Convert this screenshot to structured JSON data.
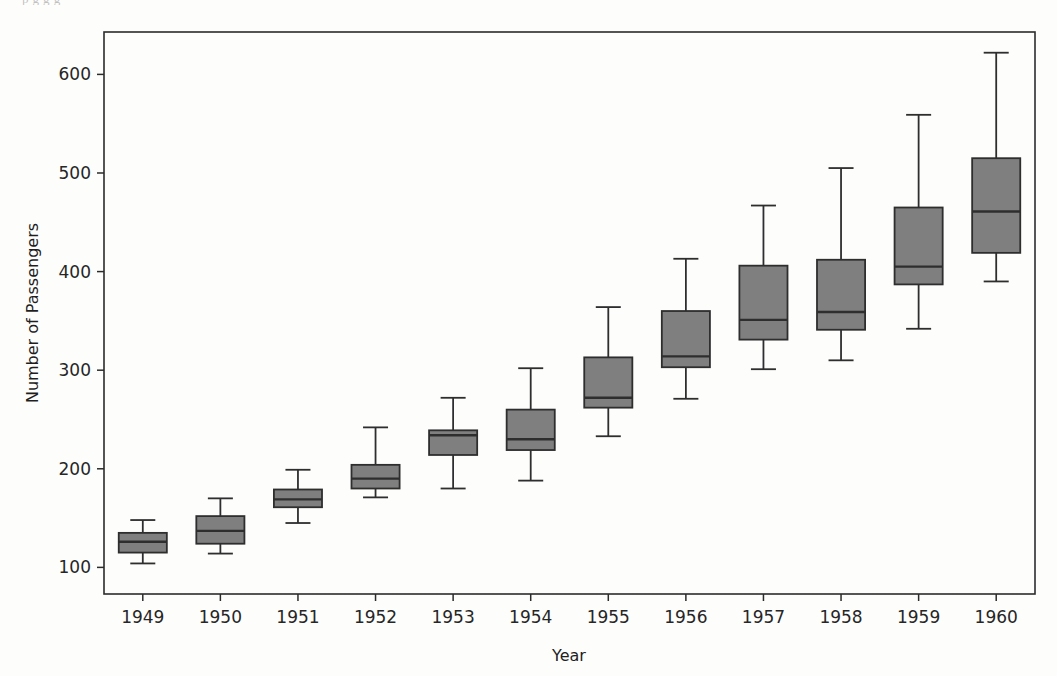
{
  "figure": {
    "background_color": "#fdfdfc",
    "plot_area": {
      "left": 104,
      "top": 32,
      "right": 1035,
      "bottom": 594
    },
    "frame_color": "#2b2b2b",
    "scan_artifact_top_text": "p    g        g              g"
  },
  "chart_data": {
    "type": "box",
    "title": "",
    "xlabel": "Year",
    "ylabel": "Number of Passengers",
    "categories": [
      "1949",
      "1950",
      "1951",
      "1952",
      "1953",
      "1954",
      "1955",
      "1956",
      "1957",
      "1958",
      "1959",
      "1960"
    ],
    "ylim": [
      73,
      643
    ],
    "yticks": [
      100,
      200,
      300,
      400,
      500,
      600
    ],
    "ytick_labels": [
      "100",
      "200",
      "300",
      "400",
      "500",
      "600"
    ],
    "grid": false,
    "legend": null,
    "box_fill_color": "#7f7f7f",
    "box_edge_color": "#2e2e2e",
    "median_color": "#2e2e2e",
    "whisker_color": "#2e2e2e",
    "boxes": [
      {
        "category": "1949",
        "whisker_low": 104,
        "q1": 115,
        "median": 126,
        "q3": 135,
        "whisker_high": 148
      },
      {
        "category": "1950",
        "whisker_low": 114,
        "q1": 124,
        "median": 137,
        "q3": 152,
        "whisker_high": 170
      },
      {
        "category": "1951",
        "whisker_low": 145,
        "q1": 161,
        "median": 169,
        "q3": 179,
        "whisker_high": 199
      },
      {
        "category": "1952",
        "whisker_low": 171,
        "q1": 180,
        "median": 190,
        "q3": 204,
        "whisker_high": 242
      },
      {
        "category": "1953",
        "whisker_low": 180,
        "q1": 214,
        "median": 234,
        "q3": 239,
        "whisker_high": 272
      },
      {
        "category": "1954",
        "whisker_low": 188,
        "q1": 219,
        "median": 230,
        "q3": 260,
        "whisker_high": 302
      },
      {
        "category": "1955",
        "whisker_low": 233,
        "q1": 262,
        "median": 272,
        "q3": 313,
        "whisker_high": 364
      },
      {
        "category": "1956",
        "whisker_low": 271,
        "q1": 303,
        "median": 314,
        "q3": 360,
        "whisker_high": 413
      },
      {
        "category": "1957",
        "whisker_low": 301,
        "q1": 331,
        "median": 351,
        "q3": 406,
        "whisker_high": 467
      },
      {
        "category": "1958",
        "whisker_low": 310,
        "q1": 341,
        "median": 359,
        "q3": 412,
        "whisker_high": 505
      },
      {
        "category": "1959",
        "whisker_low": 342,
        "q1": 387,
        "median": 405,
        "q3": 465,
        "whisker_high": 559
      },
      {
        "category": "1960",
        "whisker_low": 390,
        "q1": 419,
        "median": 461,
        "q3": 515,
        "whisker_high": 622
      }
    ]
  }
}
